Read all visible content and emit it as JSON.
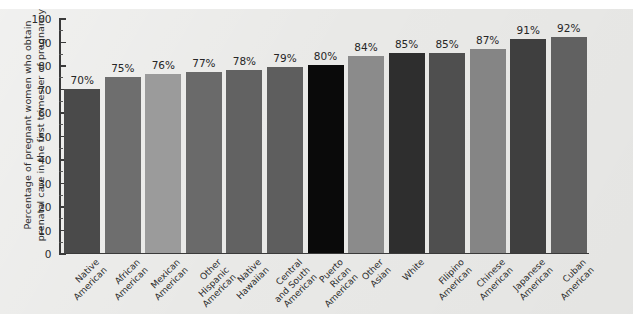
{
  "chart_data": {
    "type": "bar",
    "title": "",
    "subtitle": "",
    "xlabel": "",
    "ylabel": "Percentage of pregnant women who obtain\nprenatal care in the first trimester of pregnancy",
    "ylim": [
      0,
      100
    ],
    "ytick_step": 10,
    "yticks": [
      0,
      10,
      20,
      30,
      40,
      50,
      60,
      70,
      80,
      90,
      100
    ],
    "ytick_labels": [
      "0",
      "10",
      "20",
      "30",
      "40",
      "50",
      "60",
      "70",
      "80",
      "90",
      "100"
    ],
    "grid": false,
    "legend": null,
    "value_label_suffix": "%",
    "categories": [
      "Native\nAmerican",
      "African\nAmerican",
      "Mexican\nAmerican",
      "Other\nHispanic\nAmerican",
      "Native\nHawaiian",
      "Central\nand South\nAmerican",
      "Puerto\nRican\nAmerican",
      "Other\nAsian",
      "White",
      "Filipino\nAmerican",
      "Chinese\nAmerican",
      "Japanese\nAmerican",
      "Cuban\nAmerican"
    ],
    "values": [
      70,
      75,
      76,
      77,
      78,
      79,
      80,
      84,
      85,
      85,
      87,
      91,
      92
    ],
    "value_labels": [
      "70%",
      "75%",
      "76%",
      "77%",
      "78%",
      "79%",
      "80%",
      "84%",
      "85%",
      "85%",
      "87%",
      "91%",
      "92%"
    ],
    "bar_colors": [
      "#4a4a4a",
      "#6e6e6e",
      "#9b9b9b",
      "#6a6a6a",
      "#626262",
      "#5e5e5e",
      "#0a0a0a",
      "#8b8b8b",
      "#2e2e2e",
      "#4f4f4f",
      "#858585",
      "#3f3f3f",
      "#616161"
    ]
  },
  "figure": {
    "panel_color": "#e9e9e7",
    "axis_color": "#3a3a3a",
    "text_color": "#2c2c2c"
  }
}
